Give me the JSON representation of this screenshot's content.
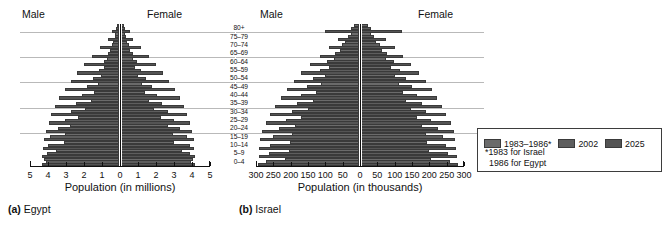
{
  "figure": {
    "panels": [
      {
        "id": "egypt",
        "caption_tag": "(a)",
        "caption_text": "Egypt",
        "male_label": "Male",
        "female_label": "Female",
        "axis_title": "Population (in millions)"
      },
      {
        "id": "israel",
        "caption_tag": "(b)",
        "caption_text": "Israel",
        "male_label": "Male",
        "female_label": "Female",
        "axis_title": "Population (in thousands)"
      }
    ]
  },
  "legend": {
    "items": [
      {
        "label": "1983–1986*",
        "color": "#6b6b6b"
      },
      {
        "label": "2002",
        "color": "#5e5e5e"
      },
      {
        "label": "2025",
        "color": "#545454"
      }
    ],
    "note_line1": "*1983 for Israel",
    "note_line2": "1986 for Egypt"
  },
  "chart_data": [
    {
      "type": "bar",
      "subtype": "population-pyramid",
      "title": "(a) Egypt",
      "xlabel": "Population (in millions)",
      "ylabel": "",
      "units": "millions",
      "xlim": [
        -5,
        5
      ],
      "xticks": [
        5,
        4,
        3,
        2,
        1,
        0,
        1,
        2,
        3,
        4,
        5
      ],
      "grid": true,
      "legend_position": "outside-right",
      "categories": [
        "0–4",
        "5–9",
        "10–14",
        "15–19",
        "20–24",
        "25–29",
        "30–34",
        "35–39",
        "40–44",
        "45–49",
        "50–54",
        "55–59",
        "60–64",
        "65–69",
        "70–74",
        "75–79",
        "80+"
      ],
      "series": [
        {
          "name": "1986",
          "sex": "male",
          "values": [
            4.2,
            3.55,
            3.1,
            3.05,
            2.75,
            2.3,
            1.9,
            1.6,
            1.4,
            1.2,
            1.0,
            0.82,
            0.66,
            0.5,
            0.34,
            0.2,
            0.13
          ]
        },
        {
          "name": "1986",
          "sex": "female",
          "values": [
            4.05,
            3.4,
            2.95,
            2.9,
            2.62,
            2.22,
            1.85,
            1.56,
            1.36,
            1.17,
            0.98,
            0.81,
            0.66,
            0.51,
            0.36,
            0.22,
            0.16
          ]
        },
        {
          "name": "2002",
          "sex": "male",
          "values": [
            4.1,
            4.05,
            4.0,
            3.85,
            3.45,
            3.05,
            2.7,
            2.4,
            2.1,
            1.8,
            1.45,
            1.12,
            0.86,
            0.62,
            0.42,
            0.25,
            0.16
          ]
        },
        {
          "name": "2002",
          "sex": "female",
          "values": [
            3.95,
            3.9,
            3.85,
            3.7,
            3.32,
            2.95,
            2.62,
            2.33,
            2.04,
            1.76,
            1.43,
            1.12,
            0.88,
            0.66,
            0.46,
            0.29,
            0.2
          ]
        },
        {
          "name": "2025",
          "sex": "male",
          "values": [
            4.35,
            4.3,
            4.28,
            4.22,
            4.1,
            3.95,
            3.8,
            3.6,
            3.35,
            3.05,
            2.72,
            2.35,
            1.95,
            1.5,
            1.05,
            0.62,
            0.4
          ]
        },
        {
          "name": "2025",
          "sex": "female",
          "values": [
            4.18,
            4.14,
            4.12,
            4.08,
            3.98,
            3.85,
            3.72,
            3.54,
            3.3,
            3.02,
            2.7,
            2.36,
            1.98,
            1.56,
            1.12,
            0.7,
            0.5
          ]
        }
      ]
    },
    {
      "type": "bar",
      "subtype": "population-pyramid",
      "title": "(b) Israel",
      "xlabel": "Population (in thousands)",
      "ylabel": "",
      "units": "thousands",
      "xlim": [
        -300,
        300
      ],
      "xticks": [
        300,
        250,
        200,
        150,
        100,
        50,
        0,
        50,
        100,
        150,
        200,
        250,
        300
      ],
      "grid": true,
      "legend_position": "outside-right",
      "categories": [
        "0–4",
        "5–9",
        "10–14",
        "15–19",
        "20–24",
        "25–29",
        "30–34",
        "35–39",
        "40–44",
        "45–49",
        "50–54",
        "55–59",
        "60–64",
        "65–69",
        "70–74",
        "75–79",
        "80+"
      ],
      "series": [
        {
          "name": "1983",
          "sex": "male",
          "values": [
            215,
            205,
            200,
            195,
            185,
            170,
            150,
            135,
            125,
            112,
            100,
            88,
            72,
            56,
            40,
            24,
            14
          ]
        },
        {
          "name": "1983",
          "sex": "female",
          "values": [
            205,
            198,
            193,
            188,
            178,
            164,
            146,
            132,
            122,
            110,
            99,
            88,
            74,
            60,
            45,
            29,
            19
          ]
        },
        {
          "name": "2002",
          "sex": "male",
          "values": [
            270,
            262,
            258,
            250,
            232,
            212,
            196,
            182,
            168,
            152,
            134,
            115,
            92,
            70,
            50,
            32,
            22
          ]
        },
        {
          "name": "2002",
          "sex": "female",
          "values": [
            258,
            252,
            248,
            240,
            224,
            205,
            190,
            177,
            164,
            149,
            132,
            115,
            95,
            75,
            56,
            39,
            30
          ]
        },
        {
          "name": "2025",
          "sex": "male",
          "values": [
            295,
            292,
            290,
            288,
            282,
            272,
            258,
            244,
            228,
            210,
            190,
            168,
            142,
            115,
            88,
            62,
            100
          ]
        },
        {
          "name": "2025",
          "sex": "female",
          "values": [
            282,
            279,
            277,
            275,
            270,
            261,
            248,
            236,
            222,
            206,
            188,
            168,
            146,
            122,
            98,
            74,
            118
          ]
        }
      ]
    }
  ]
}
